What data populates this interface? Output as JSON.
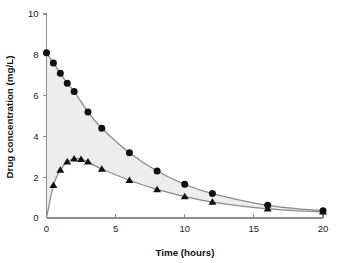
{
  "chart_data": {
    "type": "line",
    "title": "",
    "subtitle": "",
    "xlabel": "Time (hours)",
    "ylabel": "Drug concentration (mg/L)",
    "xlim": [
      0,
      20
    ],
    "ylim": [
      0,
      10
    ],
    "xticks": [
      0,
      5,
      10,
      15,
      20
    ],
    "yticks": [
      0,
      2,
      4,
      6,
      8,
      10
    ],
    "xtick_labels": [
      "0",
      "5",
      "10",
      "15",
      "20"
    ],
    "ytick_labels": [
      "0",
      "2",
      "4",
      "6",
      "8",
      "10"
    ],
    "grid": false,
    "legend": "none",
    "annotations": [
      "shaded band between the two concentration-time curves"
    ],
    "series": [
      {
        "name": "intravenous bolus",
        "marker": "circle",
        "color": "#111111",
        "x": [
          0,
          0.5,
          1,
          1.5,
          2,
          3,
          4,
          6,
          8,
          10,
          12,
          16,
          20
        ],
        "y": [
          8.1,
          7.6,
          7.1,
          6.6,
          6.2,
          5.2,
          4.4,
          3.2,
          2.3,
          1.65,
          1.2,
          0.62,
          0.35
        ]
      },
      {
        "name": "oral dose",
        "marker": "triangle",
        "color": "#111111",
        "x": [
          0,
          0.5,
          1,
          1.5,
          2,
          2.5,
          3,
          4,
          6,
          8,
          10,
          12,
          16,
          20
        ],
        "y": [
          0.0,
          1.6,
          2.35,
          2.75,
          2.9,
          2.88,
          2.75,
          2.4,
          1.85,
          1.4,
          1.05,
          0.78,
          0.45,
          0.3
        ]
      }
    ]
  },
  "axes": {
    "x_label": "Time (hours)",
    "y_label": "Drug concentration (mg/L)"
  },
  "colors": {
    "axis": "#8d8d8d",
    "curve": "#8a8a8a",
    "marker": "#111111",
    "band": "#ededed",
    "background": "#ffffff",
    "text": "#111111"
  }
}
